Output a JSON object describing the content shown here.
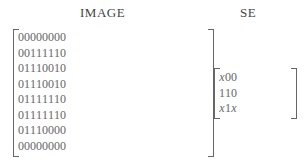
{
  "image_title": "IMAGE",
  "se_title": "SE",
  "image_matrix": [
    [
      "0",
      "0",
      "0",
      "0",
      "0",
      "0",
      "0",
      "0"
    ],
    [
      "0",
      "0",
      "1",
      "1",
      "1",
      "1",
      "1",
      "0"
    ],
    [
      "0",
      "1",
      "1",
      "1",
      "0",
      "0",
      "1",
      "0"
    ],
    [
      "0",
      "1",
      "1",
      "1",
      "0",
      "0",
      "1",
      "0"
    ],
    [
      "0",
      "1",
      "1",
      "1",
      "1",
      "1",
      "1",
      "0"
    ],
    [
      "0",
      "1",
      "1",
      "1",
      "1",
      "1",
      "1",
      "0"
    ],
    [
      "0",
      "1",
      "1",
      "1",
      "0",
      "0",
      "0",
      "0"
    ],
    [
      "0",
      "0",
      "0",
      "0",
      "0",
      "0",
      "0",
      "0"
    ]
  ],
  "se_matrix": [
    [
      "x",
      "0",
      "0"
    ],
    [
      "1",
      "1",
      "0"
    ],
    [
      "x",
      "1",
      "x"
    ]
  ]
}
